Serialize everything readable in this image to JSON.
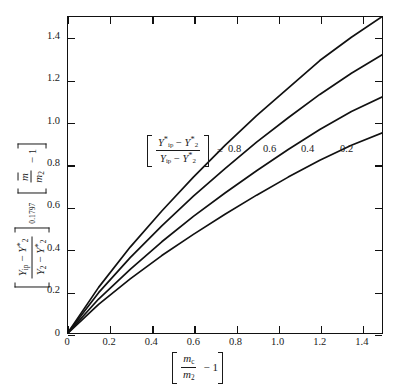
{
  "chart_data": {
    "type": "line",
    "title": "",
    "xlabel": "[ m_c / m_2 - 1 ]",
    "ylabel": "[ (Y_ip - Y*_2) / (Y_2 - Y*_2) ]^0.1797  [ m-bar / m_2 - 1 ]",
    "xlim": [
      0,
      1.5
    ],
    "ylim": [
      0,
      1.5
    ],
    "xticks": [
      "0",
      "0.2",
      "0.4",
      "0.6",
      "0.8",
      "1.0",
      "1.2",
      "1.4"
    ],
    "xtick_values": [
      0,
      0.2,
      0.4,
      0.6,
      0.8,
      1.0,
      1.2,
      1.4
    ],
    "yticks": [
      "0",
      "0.2",
      "0.4",
      "0.6",
      "0.8",
      "1.0",
      "1.2",
      "1.4"
    ],
    "ytick_values": [
      0,
      0.2,
      0.4,
      0.6,
      0.8,
      1.0,
      1.2,
      1.4
    ],
    "grid": false,
    "legend_position": "inside-upper-middle",
    "legend_parameter_label": "[ (Y*_ip - Y*_2) / (Y_ip - Y*_2) ]",
    "legend_equals": "=",
    "x": [
      0,
      0.15,
      0.3,
      0.45,
      0.6,
      0.75,
      0.9,
      1.05,
      1.2,
      1.35,
      1.5
    ],
    "series": [
      {
        "name": "0.8",
        "label": "0.8",
        "values": [
          0,
          0.22,
          0.41,
          0.58,
          0.74,
          0.89,
          1.03,
          1.16,
          1.29,
          1.4,
          1.5
        ]
      },
      {
        "name": "0.6",
        "label": "0.6",
        "values": [
          0,
          0.195,
          0.36,
          0.51,
          0.65,
          0.78,
          0.905,
          1.02,
          1.13,
          1.23,
          1.32
        ]
      },
      {
        "name": "0.4",
        "label": "0.4",
        "values": [
          0,
          0.165,
          0.305,
          0.435,
          0.555,
          0.665,
          0.77,
          0.87,
          0.965,
          1.05,
          1.12
        ]
      },
      {
        "name": "0.2",
        "label": "0.2",
        "values": [
          0,
          0.14,
          0.26,
          0.37,
          0.47,
          0.565,
          0.655,
          0.74,
          0.82,
          0.89,
          0.95
        ]
      }
    ],
    "series_label_positions": [
      {
        "label": "0.8",
        "x_px": 228,
        "y_px": 150
      },
      {
        "label": "0.6",
        "x_px": 263,
        "y_px": 150
      },
      {
        "label": "0.4",
        "x_px": 301,
        "y_px": 150
      },
      {
        "label": "0.2",
        "x_px": 340,
        "y_px": 150
      }
    ],
    "curve_color": "#111111",
    "background_color": "#ffffff",
    "axis_color": "#111111"
  },
  "axis_text": {
    "y_exponent": "0.1797",
    "y_num_sym": "Y",
    "y_num_sub": "ip",
    "y_den_sym": "Y",
    "y_den_sub": "2",
    "y_star": "*",
    "y_second_num": "m",
    "y_second_den": "m",
    "y_second_den_sub": "2",
    "y_minus_one": "− 1",
    "x_num": "m",
    "x_num_sub": "c",
    "x_den": "m",
    "x_den_sub": "2",
    "x_minus_one": "− 1",
    "minus": "−"
  }
}
